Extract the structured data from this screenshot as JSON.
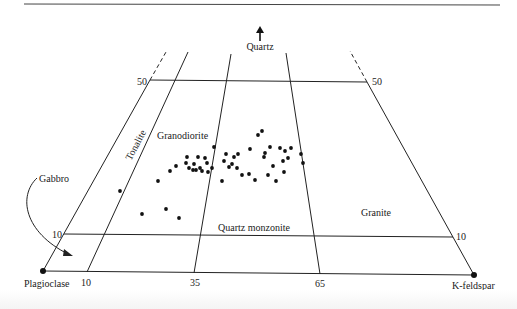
{
  "diagram": {
    "type": "QAP ternary classification diagram (lower portion)",
    "apex_label": "Quartz",
    "corners": {
      "left": "Plagioclase",
      "right": "K-feldspar"
    },
    "fields": {
      "tonalite": "Tonalite",
      "granodiorite": "Granodiorite",
      "quartz_monzonite": "Quartz monzonite",
      "granite": "Granite",
      "gabbro": "Gabbro"
    },
    "quartz_ticks": {
      "upper_left": "50",
      "upper_right": "50",
      "lower_left": "10",
      "lower_right": "10"
    },
    "base_ticks": [
      "10",
      "35",
      "65"
    ],
    "colors": {
      "line": "#222222",
      "point": "#111111",
      "background": "#ffffff"
    }
  },
  "chart_data": {
    "type": "scatter",
    "title": "",
    "xlabel": "Plagioclase → K-feldspar",
    "ylabel": "Quartz",
    "annotations": [
      "Tonalite",
      "Granodiorite",
      "Quartz monzonite",
      "Granite",
      "Gabbro"
    ],
    "tick_labels": {
      "base": [
        "10",
        "35",
        "65"
      ],
      "quartz": [
        "10",
        "50"
      ]
    },
    "points_px": [
      [
        120,
        191
      ],
      [
        142,
        214
      ],
      [
        158,
        181
      ],
      [
        166,
        209
      ],
      [
        170,
        171
      ],
      [
        176,
        166
      ],
      [
        179,
        218
      ],
      [
        186,
        163
      ],
      [
        187,
        157
      ],
      [
        189,
        168
      ],
      [
        193,
        170
      ],
      [
        194,
        164
      ],
      [
        196,
        170
      ],
      [
        198,
        157
      ],
      [
        200,
        168
      ],
      [
        202,
        171
      ],
      [
        205,
        158
      ],
      [
        207,
        163
      ],
      [
        208,
        172
      ],
      [
        212,
        168
      ],
      [
        214,
        147
      ],
      [
        222,
        181
      ],
      [
        224,
        161
      ],
      [
        226,
        154
      ],
      [
        229,
        167
      ],
      [
        232,
        164
      ],
      [
        234,
        157
      ],
      [
        237,
        168
      ],
      [
        238,
        154
      ],
      [
        242,
        175
      ],
      [
        249,
        174
      ],
      [
        250,
        149
      ],
      [
        255,
        180
      ],
      [
        258,
        135
      ],
      [
        262,
        131
      ],
      [
        264,
        157
      ],
      [
        265,
        153
      ],
      [
        268,
        175
      ],
      [
        270,
        147
      ],
      [
        273,
        166
      ],
      [
        276,
        181
      ],
      [
        280,
        148
      ],
      [
        283,
        161
      ],
      [
        284,
        172
      ],
      [
        285,
        151
      ],
      [
        288,
        158
      ],
      [
        291,
        148
      ],
      [
        301,
        154
      ],
      [
        303,
        163
      ]
    ]
  }
}
